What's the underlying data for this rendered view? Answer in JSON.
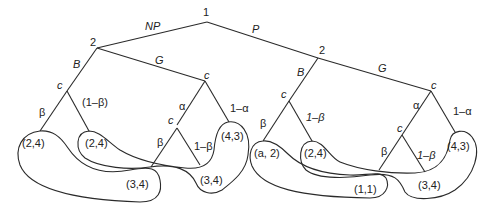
{
  "diagram": {
    "type": "extensive-form game tree",
    "root": {
      "label": "1"
    },
    "root_actions": {
      "left": "NP",
      "right": "P"
    },
    "left_subtree": {
      "player_node": "2",
      "actions": {
        "left": "B",
        "right": "G"
      },
      "B_branch": {
        "chance_node": "c",
        "probs": {
          "left": "β",
          "right": "(1–β)"
        },
        "payoffs": [
          "(2,4)",
          "(2,4)"
        ]
      },
      "G_branch": {
        "chance_node": "c",
        "probs": {
          "left": "α",
          "right": "1–α"
        },
        "inner_chance_node": "c",
        "inner_probs": {
          "left": "β",
          "right": "1–β"
        },
        "payoffs": [
          "(3,4)",
          "(3,4)",
          "(4,3)"
        ]
      }
    },
    "right_subtree": {
      "player_node": "2",
      "actions": {
        "left": "B",
        "right": "G"
      },
      "B_branch": {
        "chance_node": "c",
        "probs": {
          "left": "β",
          "right": "1–β"
        },
        "payoffs": [
          "(a, 2)",
          "(2,4)"
        ]
      },
      "G_branch": {
        "chance_node": "c",
        "probs": {
          "left": "α",
          "right": "1–α"
        },
        "inner_chance_node": "c",
        "inner_probs": {
          "left": "β",
          "right": "1–β"
        },
        "payoffs": [
          "(1,1)",
          "(3,4)",
          "(4,3)"
        ]
      }
    }
  }
}
